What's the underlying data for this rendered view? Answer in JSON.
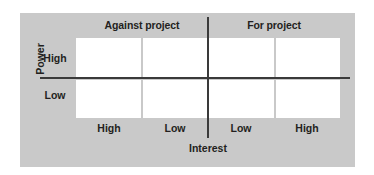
{
  "figure": {
    "type": "power-interest-stakeholder-matrix",
    "panel_color": "#c9c9c9",
    "cell_color": "#ffffff",
    "axis_color": "#3a3a3a",
    "text_color": "#231f20"
  },
  "axes": {
    "y_title": "Power",
    "x_title": "Interest",
    "y_labels": [
      "High",
      "Low"
    ],
    "x_labels": [
      "High",
      "Low",
      "Low",
      "High"
    ]
  },
  "headers": {
    "left": "Against project",
    "right": "For project"
  },
  "chart_data": {
    "type": "table",
    "title": "",
    "xlabel": "Interest",
    "ylabel": "Power",
    "column_groups": [
      "Against project",
      "For project"
    ],
    "categories": [
      "High",
      "Low",
      "Low",
      "High"
    ],
    "rows": [
      "High",
      "Low"
    ],
    "cells": [
      [
        "",
        "",
        "",
        ""
      ],
      [
        "",
        "",
        "",
        ""
      ]
    ],
    "grid": true,
    "legend": "none"
  }
}
